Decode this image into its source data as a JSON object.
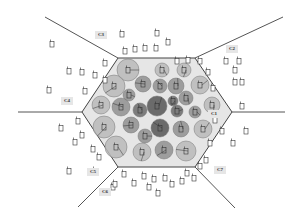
{
  "diagram": {
    "title": "",
    "center_cell": {
      "label": "C1",
      "hexagon": [
        [
          118,
          58
        ],
        [
          195,
          58
        ],
        [
          232,
          112
        ],
        [
          195,
          167
        ],
        [
          118,
          167
        ],
        [
          82,
          112
        ]
      ],
      "fill": "#e6e6e6",
      "stroke": "#444444"
    },
    "boundary_rays": [
      {
        "from": [
          118,
          58
        ],
        "to": [
          45,
          17
        ]
      },
      {
        "from": [
          195,
          58
        ],
        "to": [
          283,
          17
        ]
      },
      {
        "from": [
          232,
          112
        ],
        "to": [
          285,
          112
        ]
      },
      {
        "from": [
          195,
          167
        ],
        "to": [
          235,
          208
        ]
      },
      {
        "from": [
          118,
          167
        ],
        "to": [
          78,
          207
        ]
      },
      {
        "from": [
          82,
          112
        ],
        "to": [
          18,
          112
        ]
      }
    ],
    "cell_labels": [
      {
        "text": "C1",
        "x": 213,
        "y": 114
      },
      {
        "text": "C2",
        "x": 231,
        "y": 49
      },
      {
        "text": "C3",
        "x": 100,
        "y": 35
      },
      {
        "text": "C4",
        "x": 66,
        "y": 101
      },
      {
        "text": "C5",
        "x": 92,
        "y": 172
      },
      {
        "text": "C6",
        "x": 104,
        "y": 192
      },
      {
        "text": "C7",
        "x": 219,
        "y": 170
      }
    ],
    "shading_colors": {
      "light": "#b8b8b8",
      "medium": "#8f8f8f",
      "dark": "#6a6a6a",
      "darkest": "#555555"
    },
    "circles": [
      {
        "x": 128,
        "y": 70,
        "r": 11,
        "shade": "light"
      },
      {
        "x": 162,
        "y": 70,
        "r": 7,
        "shade": "light"
      },
      {
        "x": 184,
        "y": 70,
        "r": 7,
        "shade": "light"
      },
      {
        "x": 114,
        "y": 86,
        "r": 11,
        "shade": "light"
      },
      {
        "x": 143,
        "y": 84,
        "r": 8,
        "shade": "medium"
      },
      {
        "x": 160,
        "y": 86,
        "r": 7,
        "shade": "medium"
      },
      {
        "x": 176,
        "y": 86,
        "r": 8,
        "shade": "medium"
      },
      {
        "x": 200,
        "y": 85,
        "r": 9,
        "shade": "light"
      },
      {
        "x": 129,
        "y": 95,
        "r": 6,
        "shade": "medium"
      },
      {
        "x": 186,
        "y": 98,
        "r": 7,
        "shade": "medium"
      },
      {
        "x": 173,
        "y": 101,
        "r": 5,
        "shade": "dark"
      },
      {
        "x": 101,
        "y": 105,
        "r": 9,
        "shade": "light"
      },
      {
        "x": 121,
        "y": 107,
        "r": 9,
        "shade": "medium"
      },
      {
        "x": 140,
        "y": 110,
        "r": 7,
        "shade": "dark"
      },
      {
        "x": 157,
        "y": 106,
        "r": 10,
        "shade": "darkest"
      },
      {
        "x": 177,
        "y": 111,
        "r": 6,
        "shade": "dark"
      },
      {
        "x": 195,
        "y": 112,
        "r": 6,
        "shade": "medium"
      },
      {
        "x": 212,
        "y": 105,
        "r": 8,
        "shade": "light"
      },
      {
        "x": 104,
        "y": 127,
        "r": 11,
        "shade": "light"
      },
      {
        "x": 131,
        "y": 125,
        "r": 8,
        "shade": "medium"
      },
      {
        "x": 160,
        "y": 128,
        "r": 9,
        "shade": "darkest"
      },
      {
        "x": 181,
        "y": 129,
        "r": 8,
        "shade": "medium"
      },
      {
        "x": 203,
        "y": 129,
        "r": 9,
        "shade": "light"
      },
      {
        "x": 145,
        "y": 136,
        "r": 7,
        "shade": "medium"
      },
      {
        "x": 116,
        "y": 147,
        "r": 11,
        "shade": "light"
      },
      {
        "x": 142,
        "y": 152,
        "r": 9,
        "shade": "light"
      },
      {
        "x": 164,
        "y": 150,
        "r": 9,
        "shade": "medium"
      },
      {
        "x": 186,
        "y": 151,
        "r": 10,
        "shade": "light"
      }
    ],
    "outer_devices": [
      [
        52,
        44
      ],
      [
        122,
        34
      ],
      [
        125,
        51
      ],
      [
        135,
        49
      ],
      [
        145,
        48
      ],
      [
        156,
        48
      ],
      [
        168,
        42
      ],
      [
        157,
        33
      ],
      [
        105,
        63
      ],
      [
        82,
        72
      ],
      [
        95,
        75
      ],
      [
        69,
        71
      ],
      [
        49,
        90
      ],
      [
        85,
        91
      ],
      [
        105,
        80
      ],
      [
        177,
        61
      ],
      [
        188,
        60
      ],
      [
        200,
        61
      ],
      [
        226,
        61
      ],
      [
        239,
        61
      ],
      [
        208,
        72
      ],
      [
        235,
        70
      ],
      [
        235,
        82
      ],
      [
        213,
        88
      ],
      [
        242,
        82
      ],
      [
        242,
        106
      ],
      [
        215,
        120
      ],
      [
        222,
        131
      ],
      [
        246,
        131
      ],
      [
        210,
        143
      ],
      [
        233,
        143
      ],
      [
        206,
        160
      ],
      [
        78,
        121
      ],
      [
        61,
        128
      ],
      [
        82,
        135
      ],
      [
        75,
        142
      ],
      [
        93,
        149
      ],
      [
        99,
        157
      ],
      [
        69,
        171
      ],
      [
        95,
        171
      ],
      [
        124,
        174
      ],
      [
        134,
        183
      ],
      [
        144,
        176
      ],
      [
        154,
        179
      ],
      [
        165,
        178
      ],
      [
        172,
        184
      ],
      [
        182,
        181
      ],
      [
        187,
        173
      ],
      [
        194,
        178
      ],
      [
        200,
        166
      ],
      [
        113,
        187
      ],
      [
        115,
        184
      ],
      [
        149,
        187
      ],
      [
        158,
        193
      ]
    ],
    "device_icon": "mobile-phone-icon"
  }
}
